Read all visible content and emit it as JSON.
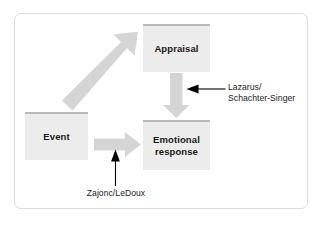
{
  "figure": {
    "type": "flow-diagram",
    "title": "",
    "frame_color": "#dcdcdc",
    "background": "#ffffff"
  },
  "nodes": [
    {
      "id": "appraisal",
      "label": "Appraisal",
      "fill": "#ececec",
      "accent": "#b9b9b9"
    },
    {
      "id": "event",
      "label": "Event",
      "fill": "#ececec",
      "accent": "#b9b9b9"
    },
    {
      "id": "emotional_response",
      "label": "Emotional\nresponse",
      "fill": "#ececec",
      "accent": "#b9b9b9"
    }
  ],
  "flow_arrows": [
    {
      "id": "event-to-appraisal",
      "from": "event",
      "to": "appraisal",
      "style": "thick-gray-block",
      "color": "#d3d3d3"
    },
    {
      "id": "appraisal-to-emotional",
      "from": "appraisal",
      "to": "emotional_response",
      "style": "thick-gray-block",
      "color": "#d3d3d3"
    },
    {
      "id": "event-to-emotional",
      "from": "event",
      "to": "emotional_response",
      "style": "thick-gray-block",
      "color": "#d3d3d3"
    }
  ],
  "annotations": [
    {
      "id": "lazarus",
      "text": "Lazarus/\nSchachter-Singer",
      "points_to": "appraisal-to-emotional",
      "pointer": "left-arrow",
      "color": "#000000"
    },
    {
      "id": "zajonc",
      "text": "Zajonc/LeDoux",
      "points_to": "event-to-emotional",
      "pointer": "up-arrow",
      "color": "#000000"
    }
  ]
}
